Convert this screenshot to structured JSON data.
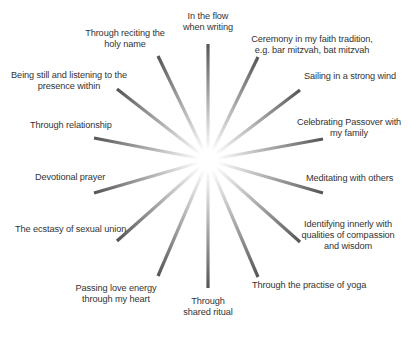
{
  "diagram": {
    "type": "radial-spokes",
    "colors": {
      "ray_outer": "#555555",
      "ray_inner": "#ffffff",
      "text": "#333333",
      "background": "#ffffff"
    },
    "spokes": [
      {
        "label": "In the flow\nwhen writing"
      },
      {
        "label": "Ceremony in my faith tradition,\ne.g. bar mitzvah, bat mitzvah"
      },
      {
        "label": "Sailing in a strong wind"
      },
      {
        "label": "Celebrating Passover with\nmy family"
      },
      {
        "label": "Meditating with others"
      },
      {
        "label": "Identifying innerly with\nqualities of compassion\nand wisdom"
      },
      {
        "label": "Through the practise of yoga"
      },
      {
        "label": "Through\nshared ritual"
      },
      {
        "label": "Passing love energy\nthrough my heart"
      },
      {
        "label": "The ecstasy of sexual union"
      },
      {
        "label": "Devotional prayer"
      },
      {
        "label": "Through relationship"
      },
      {
        "label": "Being still and listening to the\npresence within"
      },
      {
        "label": "Through reciting the\nholy name"
      }
    ]
  }
}
